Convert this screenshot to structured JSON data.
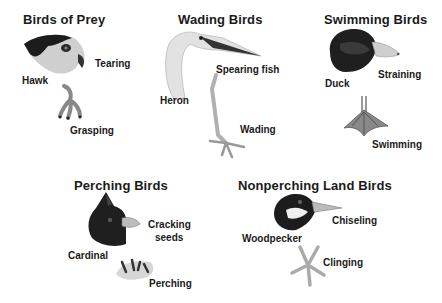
{
  "groups": [
    {
      "title": "Birds of Prey",
      "bird": "Hawk",
      "beak": "Tearing",
      "foot": "Grasping"
    },
    {
      "title": "Wading Birds",
      "bird": "Heron",
      "beak": "Spearing fish",
      "foot": "Wading"
    },
    {
      "title": "Swimming Birds",
      "bird": "Duck",
      "beak": "Straining",
      "foot": "Swimming"
    },
    {
      "title": "Perching Birds",
      "bird": "Cardinal",
      "beak_line1": "Cracking",
      "beak_line2": "seeds",
      "foot": "Perching"
    },
    {
      "title": "Nonperching Land Birds",
      "bird": "Woodpecker",
      "beak": "Chiseling",
      "foot": "Clinging"
    }
  ],
  "icons": {
    "hawk": "hawk-head-illustration",
    "heron": "heron-head-illustration",
    "duck": "duck-head-illustration",
    "cardinal": "cardinal-head-illustration",
    "woodpecker": "woodpecker-head-illustration"
  }
}
